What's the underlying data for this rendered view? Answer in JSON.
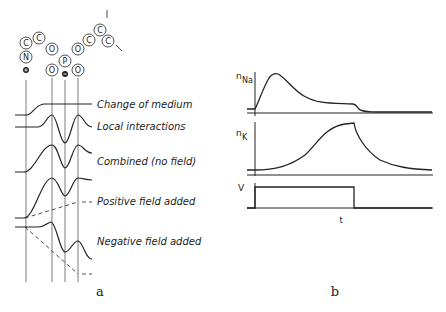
{
  "panel_a": {
    "label": "a",
    "molecule": {
      "atoms": [
        "N",
        "C",
        "C",
        "O",
        "P",
        "O",
        "O",
        "O",
        "O",
        "C",
        "C",
        "C"
      ],
      "charges": {
        "N": "+",
        "P": "−"
      }
    },
    "curves": [
      {
        "id": "change-of-medium",
        "label": "Change of medium"
      },
      {
        "id": "local-interactions",
        "label": "Local interactions"
      },
      {
        "id": "combined",
        "label": "Combined (no field)"
      },
      {
        "id": "positive-field",
        "label": "Positive field added"
      },
      {
        "id": "negative-field",
        "label": "Negative field added"
      }
    ]
  },
  "panel_b": {
    "label": "b",
    "traces": [
      {
        "id": "n-na",
        "axis_label": "n",
        "subscript": "Na"
      },
      {
        "id": "n-k",
        "axis_label": "n",
        "subscript": "K"
      },
      {
        "id": "v",
        "axis_label": "V",
        "subscript": ""
      }
    ],
    "time_label": "t"
  }
}
